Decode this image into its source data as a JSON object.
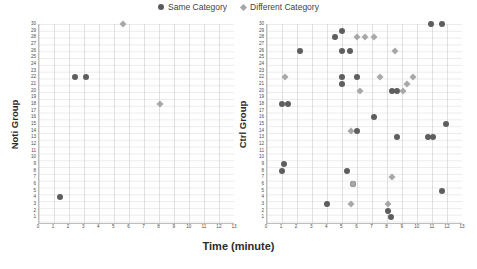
{
  "legend": {
    "items": [
      {
        "label": "Same Category",
        "marker": "circle",
        "color": "#5e5e5e"
      },
      {
        "label": "Different Category",
        "marker": "diamond",
        "color": "#a8a8a8"
      }
    ]
  },
  "axis": {
    "xlabel": "Time (minute)",
    "xticks": [
      0,
      1,
      2,
      3,
      4,
      5,
      6,
      7,
      8,
      9,
      10,
      11,
      12,
      13
    ],
    "yticks": [
      1,
      2,
      3,
      4,
      5,
      6,
      7,
      8,
      9,
      10,
      11,
      12,
      13,
      14,
      15,
      16,
      17,
      18,
      19,
      20,
      21,
      22,
      23,
      24,
      25,
      26,
      27,
      28,
      29,
      30
    ]
  },
  "chart_data": [
    {
      "type": "scatter",
      "title": "",
      "xlabel": "Time (minute)",
      "ylabel": "Noti Group",
      "xlim": [
        0,
        13
      ],
      "ylim": [
        1,
        30
      ],
      "grid": true,
      "legend_position": "top-center",
      "series": [
        {
          "name": "Same Category",
          "marker": "circle",
          "color": "#5e5e5e",
          "points": [
            {
              "x": 2.4,
              "y": 22
            },
            {
              "x": 3.1,
              "y": 22
            },
            {
              "x": 1.4,
              "y": 4
            }
          ]
        },
        {
          "name": "Different Category",
          "marker": "diamond",
          "color": "#a8a8a8",
          "points": [
            {
              "x": 5.6,
              "y": 30
            },
            {
              "x": 8.0,
              "y": 18
            }
          ]
        }
      ]
    },
    {
      "type": "scatter",
      "title": "",
      "xlabel": "Time (minute)",
      "ylabel": "Ctrl Group",
      "xlim": [
        0,
        13
      ],
      "ylim": [
        1,
        30
      ],
      "grid": true,
      "legend_position": "top-center",
      "series": [
        {
          "name": "Same Category",
          "marker": "circle",
          "color": "#5e5e5e",
          "points": [
            {
              "x": 10.9,
              "y": 30
            },
            {
              "x": 11.6,
              "y": 30
            },
            {
              "x": 5.0,
              "y": 29
            },
            {
              "x": 4.5,
              "y": 28
            },
            {
              "x": 2.2,
              "y": 26
            },
            {
              "x": 5.0,
              "y": 26
            },
            {
              "x": 5.5,
              "y": 26
            },
            {
              "x": 5.0,
              "y": 22
            },
            {
              "x": 6.0,
              "y": 22
            },
            {
              "x": 5.0,
              "y": 21
            },
            {
              "x": 8.3,
              "y": 20
            },
            {
              "x": 8.6,
              "y": 20
            },
            {
              "x": 1.0,
              "y": 18
            },
            {
              "x": 1.4,
              "y": 18
            },
            {
              "x": 7.1,
              "y": 16
            },
            {
              "x": 11.9,
              "y": 15
            },
            {
              "x": 6.0,
              "y": 14
            },
            {
              "x": 8.6,
              "y": 13
            },
            {
              "x": 10.7,
              "y": 13
            },
            {
              "x": 11.0,
              "y": 13
            },
            {
              "x": 1.1,
              "y": 9
            },
            {
              "x": 1.0,
              "y": 8
            },
            {
              "x": 5.3,
              "y": 8
            },
            {
              "x": 5.7,
              "y": 6
            },
            {
              "x": 11.6,
              "y": 5
            },
            {
              "x": 4.0,
              "y": 3
            },
            {
              "x": 8.0,
              "y": 2
            },
            {
              "x": 8.2,
              "y": 1
            }
          ]
        },
        {
          "name": "Different Category",
          "marker": "diamond",
          "color": "#a8a8a8",
          "points": [
            {
              "x": 6.0,
              "y": 28
            },
            {
              "x": 6.5,
              "y": 28
            },
            {
              "x": 7.1,
              "y": 28
            },
            {
              "x": 8.5,
              "y": 26
            },
            {
              "x": 1.2,
              "y": 22
            },
            {
              "x": 7.5,
              "y": 22
            },
            {
              "x": 9.7,
              "y": 22
            },
            {
              "x": 9.3,
              "y": 21
            },
            {
              "x": 6.2,
              "y": 20
            },
            {
              "x": 9.0,
              "y": 20
            },
            {
              "x": 5.6,
              "y": 14
            },
            {
              "x": 8.3,
              "y": 7
            },
            {
              "x": 5.7,
              "y": 6
            },
            {
              "x": 5.6,
              "y": 3
            },
            {
              "x": 8.0,
              "y": 3
            }
          ]
        }
      ]
    }
  ]
}
